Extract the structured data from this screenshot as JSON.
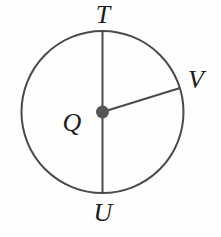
{
  "figure": {
    "type": "circle-geometry-diagram",
    "background_color": "#fefefe",
    "stroke_color": "#4a4a4a",
    "center_dot_color": "#555555",
    "label_color": "#1c1c1c",
    "circle": {
      "center_label": "Q",
      "center_x": 102.5,
      "center_y": 112,
      "radius": 81,
      "stroke_width": 2
    },
    "center_dot": {
      "radius": 6.5
    },
    "segments": [
      {
        "name": "diameter-TU",
        "from": "T",
        "to": "U",
        "x1": 102.5,
        "y1": 31,
        "x2": 102.5,
        "y2": 193
      },
      {
        "name": "radius-QV",
        "from": "Q",
        "to": "V",
        "x1": 102.5,
        "y1": 112,
        "x2": 180,
        "y2": 88
      }
    ],
    "labels": [
      {
        "id": "T",
        "text": "T",
        "x": 102,
        "y": 14,
        "position": "top"
      },
      {
        "id": "Q",
        "text": "Q",
        "x": 72,
        "y": 122,
        "position": "center-left"
      },
      {
        "id": "V",
        "text": "V",
        "x": 196,
        "y": 79,
        "position": "upper-right"
      },
      {
        "id": "U",
        "text": "U",
        "x": 103,
        "y": 212,
        "position": "bottom"
      }
    ]
  }
}
